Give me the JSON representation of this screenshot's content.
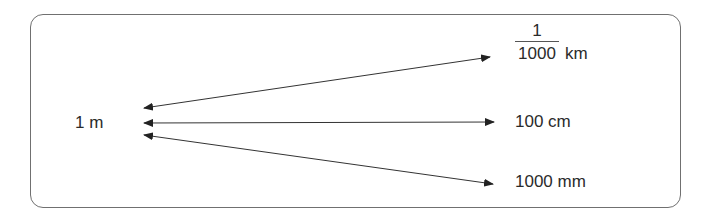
{
  "diagram": {
    "source": {
      "label": "1 m"
    },
    "targets": [
      {
        "id": "km",
        "numerator": "1",
        "denominator": "1000",
        "unit": "km"
      },
      {
        "id": "cm",
        "label": "100 cm"
      },
      {
        "id": "mm",
        "label": "1000 mm"
      }
    ],
    "arrows": [
      {
        "from": "1 m",
        "to": "1/1000 km",
        "bidirectional": true
      },
      {
        "from": "1 m",
        "to": "100 cm",
        "bidirectional": true
      },
      {
        "from": "1 m",
        "to": "1000 mm",
        "bidirectional": true
      }
    ],
    "colors": {
      "stroke": "#333333",
      "border": "#707070",
      "text": "#2b2b2b"
    }
  }
}
